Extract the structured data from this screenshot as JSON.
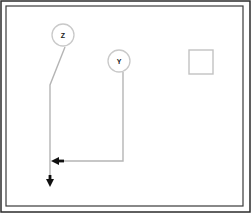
{
  "diagram": {
    "title": "",
    "canvas": {
      "width": 251,
      "height": 213,
      "background": "#ffffff"
    },
    "colors": {
      "outer_border": "#2b2b2b",
      "inner_frame": "#3a3a3a",
      "line": "#b5b5b5",
      "node_stroke": "#c9c9c9",
      "node_fill": "#ffffff",
      "arrowhead": "#111111",
      "shape_stroke": "#c2c2c2",
      "label_text": "#1a1a1a"
    },
    "outer_border": {
      "x": 1,
      "y": 1,
      "width": 249,
      "height": 211,
      "stroke_width": 1.5
    },
    "inner_frame": {
      "x": 6,
      "y": 6,
      "width": 237,
      "height": 200,
      "stroke_width": 1.2
    },
    "nodes": [
      {
        "id": "node-z",
        "label": "Z",
        "cx": 63,
        "cy": 35,
        "r": 11
      },
      {
        "id": "node-y",
        "label": "Y",
        "cx": 119,
        "cy": 61,
        "r": 11
      }
    ],
    "shapes": [
      {
        "id": "square-1",
        "type": "square",
        "x": 189,
        "y": 50,
        "width": 24,
        "height": 24,
        "label": ""
      }
    ],
    "connectors": [
      {
        "id": "connector-z",
        "from": "node-z",
        "points": "65,47 50,85 50,180",
        "arrow": "down",
        "arrow_x": 50,
        "arrow_y": 186
      },
      {
        "id": "connector-y",
        "from": "node-y",
        "points": "123,72 123,161 60,161",
        "arrow": "left",
        "arrow_x": 53,
        "arrow_y": 161
      }
    ]
  }
}
